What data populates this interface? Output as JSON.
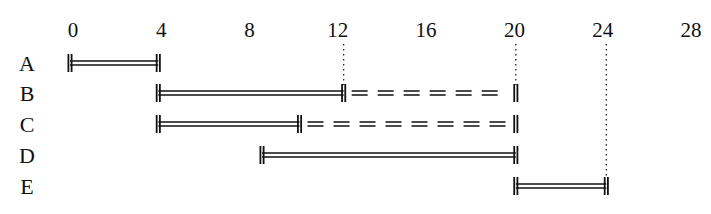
{
  "chart_data": {
    "type": "gantt",
    "title": "",
    "xlabel": "",
    "ylabel": "",
    "xlim": [
      0,
      28
    ],
    "ticks": [
      0,
      4,
      8,
      12,
      16,
      20,
      24,
      28
    ],
    "tick_labels": [
      "0",
      "4",
      "8",
      "12",
      "16",
      "20",
      "24",
      "28"
    ],
    "categories": [
      "A",
      "B",
      "C",
      "D",
      "E"
    ],
    "tasks": [
      {
        "name": "A",
        "start": 0,
        "end": 4,
        "slack_end": null
      },
      {
        "name": "B",
        "start": 4,
        "end": 12.4,
        "slack_end": 20.2
      },
      {
        "name": "C",
        "start": 4,
        "end": 10.4,
        "slack_end": 20.2
      },
      {
        "name": "D",
        "start": 8.7,
        "end": 20.2,
        "slack_end": null
      },
      {
        "name": "E",
        "start": 20.2,
        "end": 24.3,
        "slack_end": null
      }
    ],
    "reference_lines": [
      12.4,
      20.2,
      24.3
    ],
    "legend": {
      "solid": "activity duration",
      "dashed": "float / slack"
    },
    "grid": false
  }
}
